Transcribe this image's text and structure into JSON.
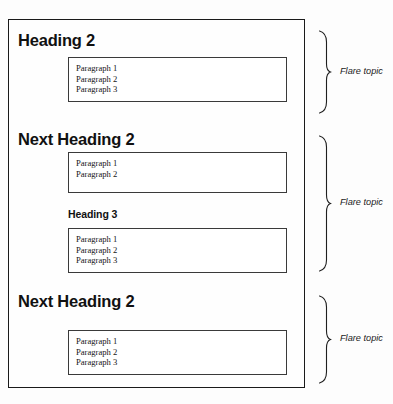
{
  "diagram": {
    "document_frame": {
      "name": "source-document"
    },
    "sections": [
      {
        "heading": {
          "level": 2,
          "text": "Heading 2"
        },
        "boxes": [
          {
            "paragraphs": [
              "Paragraph 1",
              "Paragraph 2",
              "Paragraph 3"
            ]
          }
        ],
        "annotation": {
          "label": "Flare topic"
        }
      },
      {
        "heading": {
          "level": 2,
          "text": "Next Heading 2"
        },
        "boxes": [
          {
            "paragraphs": [
              "Paragraph 1",
              "Paragraph 2"
            ]
          },
          {
            "subheading": {
              "level": 3,
              "text": "Heading 3"
            },
            "paragraphs": [
              "Paragraph 1",
              "Paragraph 2",
              "Paragraph 3"
            ]
          }
        ],
        "annotation": {
          "label": "Flare topic"
        }
      },
      {
        "heading": {
          "level": 2,
          "text": "Next Heading 2"
        },
        "boxes": [
          {
            "paragraphs": [
              "Paragraph 1",
              "Paragraph 2",
              "Paragraph 3"
            ]
          }
        ],
        "annotation": {
          "label": "Flare topic"
        }
      }
    ],
    "colors": {
      "frame_stroke": "#1a1a1a",
      "box_stroke": "#3a3a3a",
      "text": "#111111",
      "background": "#fdfdfd"
    }
  }
}
